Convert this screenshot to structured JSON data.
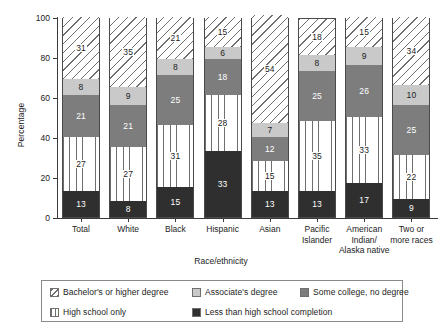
{
  "chart_data": {
    "type": "bar",
    "subtype": "stacked-bar-100",
    "title": "",
    "xlabel": "Race/ethnicity",
    "ylabel": "Percentage",
    "ylim": [
      0,
      100
    ],
    "yticks": [
      0,
      20,
      40,
      60,
      80,
      100
    ],
    "grid": false,
    "legend_position": "bottom",
    "categories": [
      "Total",
      "White",
      "Black",
      "Hispanic",
      "Asian",
      "Pacific Islander",
      "American Indian/ Alaska native",
      "Two or more races"
    ],
    "category_lines": [
      [
        "Total"
      ],
      [
        "White"
      ],
      [
        "Black"
      ],
      [
        "Hispanic"
      ],
      [
        "Asian"
      ],
      [
        "Pacific",
        "Islander"
      ],
      [
        "American",
        "Indian/",
        "Alaska native"
      ],
      [
        "Two or",
        "more races"
      ]
    ],
    "series": [
      {
        "name": "Less than high school completion",
        "key": "lessthanhs",
        "fill": "solid-dark",
        "color": "#2f2f2f",
        "label_color": "light",
        "values": [
          13,
          8,
          15,
          33,
          13,
          13,
          17,
          9
        ]
      },
      {
        "name": "High school only",
        "key": "highschool",
        "fill": "vertical-lines",
        "color": "#ffffff",
        "label_color": "dark",
        "values": [
          27,
          27,
          31,
          28,
          15,
          35,
          33,
          22
        ]
      },
      {
        "name": "Some college, no degree",
        "key": "somecollege",
        "fill": "solid-mid",
        "color": "#7d7d7d",
        "label_color": "light",
        "values": [
          21,
          21,
          25,
          18,
          12,
          25,
          26,
          25
        ]
      },
      {
        "name": "Associate's degree",
        "key": "associate",
        "fill": "solid-light",
        "color": "#c9c9c9",
        "label_color": "dark",
        "values": [
          8,
          9,
          8,
          6,
          7,
          8,
          9,
          10
        ]
      },
      {
        "name": "Bachelor's or higher degree",
        "key": "bachelor",
        "fill": "diagonal-hatch",
        "color": "#ffffff",
        "label_color": "dark",
        "values": [
          31,
          35,
          21,
          15,
          54,
          18,
          15,
          34
        ]
      }
    ]
  },
  "legend": {
    "rows": [
      [
        {
          "swatch": "bachelor",
          "label": "Bachelor's or higher degree"
        },
        {
          "swatch": "associate",
          "label": "Associate's degree"
        },
        {
          "swatch": "somecollege",
          "label": "Some college, no degree"
        }
      ],
      [
        {
          "swatch": "highschool",
          "label": "High school only"
        },
        {
          "swatch": "lessthanhs",
          "label": "Less than high school completion"
        }
      ]
    ]
  }
}
